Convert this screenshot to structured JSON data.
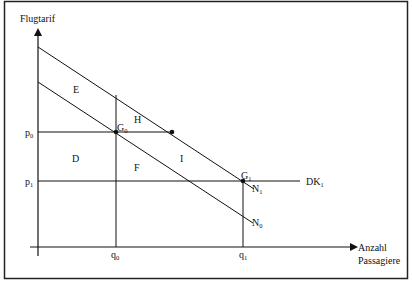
{
  "diagram": {
    "y_axis_label": "Flugtarif",
    "x_axis_label_line1": "Anzahl",
    "x_axis_label_line2": "Passagiere",
    "price_levels": [
      {
        "id": "p0",
        "base": "p",
        "sub": "0"
      },
      {
        "id": "p1",
        "base": "p",
        "sub": "1"
      }
    ],
    "quantity_levels": [
      {
        "id": "q0",
        "base": "q",
        "sub": "0"
      },
      {
        "id": "q1",
        "base": "q",
        "sub": "1"
      }
    ],
    "points": [
      {
        "id": "G0",
        "base": "G",
        "sub": "0"
      },
      {
        "id": "G1",
        "base": "G",
        "sub": "1"
      }
    ],
    "curves": [
      {
        "id": "N0",
        "base": "N",
        "sub": "0"
      },
      {
        "id": "N1",
        "base": "N",
        "sub": "1"
      },
      {
        "id": "DK1",
        "base": "DK",
        "sub": "1"
      }
    ],
    "regions": [
      "E",
      "H",
      "D",
      "F",
      "I"
    ],
    "line_color": "#111111",
    "frame_color": "#222222"
  }
}
